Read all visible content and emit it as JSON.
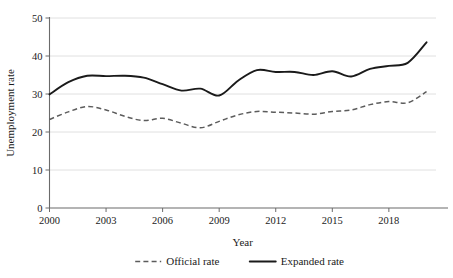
{
  "chart_data": {
    "type": "line",
    "title": "",
    "xlabel": "Year",
    "ylabel": "Unemployment rate",
    "xlim": [
      2000,
      2020.5
    ],
    "ylim": [
      0,
      50
    ],
    "xticks": [
      2000,
      2003,
      2006,
      2009,
      2012,
      2015,
      2018
    ],
    "xtick_labels": [
      "2000",
      "2003",
      "2006",
      "2009",
      "2012",
      "2015",
      "2018"
    ],
    "yticks": [
      0,
      10,
      20,
      30,
      40,
      50
    ],
    "ytick_labels": [
      "0",
      "10",
      "20",
      "30",
      "40",
      "50"
    ],
    "grid": "horizontal",
    "legend_position": "below",
    "x": [
      2000,
      2001,
      2002,
      2003,
      2004,
      2005,
      2006,
      2007,
      2008,
      2009,
      2010,
      2011,
      2012,
      2013,
      2014,
      2015,
      2016,
      2017,
      2018,
      2019,
      2020
    ],
    "series": [
      {
        "name": "Official rate",
        "style": "dashed",
        "color": "#5c5c5c",
        "values": [
          23.3,
          25.3,
          26.7,
          25.8,
          24.1,
          23.0,
          23.6,
          22.3,
          21.1,
          22.8,
          24.5,
          25.4,
          25.2,
          25.0,
          24.7,
          25.4,
          25.8,
          27.2,
          28.0,
          27.7,
          30.6
        ]
      },
      {
        "name": "Expanded rate",
        "style": "solid",
        "color": "#1a1a1a",
        "values": [
          29.9,
          33.1,
          34.8,
          34.7,
          34.8,
          34.3,
          32.6,
          30.9,
          31.4,
          29.6,
          33.5,
          36.3,
          35.8,
          35.8,
          35.0,
          36.0,
          34.6,
          36.6,
          37.4,
          38.2,
          43.6
        ]
      }
    ],
    "legend": [
      {
        "label": "Official rate",
        "style": "dashed"
      },
      {
        "label": "Expanded rate",
        "style": "solid"
      }
    ]
  }
}
